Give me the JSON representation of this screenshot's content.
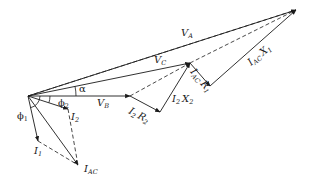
{
  "diagram": {
    "type": "phasor-diagram",
    "colors": {
      "line": "#1a1a1a",
      "background": "#ffffff"
    },
    "points": {
      "O": [
        28,
        96
      ],
      "VB": [
        130,
        96
      ],
      "R2": [
        160,
        112
      ],
      "VC": [
        190,
        63
      ],
      "R1": [
        210,
        86
      ],
      "VA": [
        296,
        10
      ],
      "I1": [
        38,
        141
      ],
      "I2": [
        68,
        109
      ],
      "IAC": [
        78,
        165
      ]
    },
    "labels": {
      "VA": {
        "main": "V",
        "sub": "A"
      },
      "VC": {
        "main": "V",
        "sub": "C"
      },
      "VB": {
        "main": "V",
        "sub": "B"
      },
      "alpha": "α",
      "phi1": {
        "main": "ϕ",
        "sub": "1"
      },
      "phi2": {
        "main": "ϕ",
        "sub": "2"
      },
      "I1": {
        "main": "I",
        "sub": "1"
      },
      "I2": {
        "main": "I",
        "sub": "2"
      },
      "IAC": {
        "main": "I",
        "sub": "AC"
      },
      "I2R2": {
        "a": "I",
        "asub": "2",
        "b": "R",
        "bsub": "2"
      },
      "I2X2": {
        "a": "I",
        "asub": "2",
        "b": "X",
        "bsub": "2"
      },
      "IACR1": {
        "a": "I",
        "asub": "AC",
        "b": "R",
        "bsub": "1"
      },
      "IACX1": {
        "a": "I",
        "asub": "AC",
        "b": "X",
        "bsub": "1"
      }
    }
  }
}
